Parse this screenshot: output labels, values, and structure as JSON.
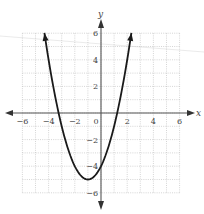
{
  "chart_data": {
    "type": "line",
    "title": "",
    "xlabel": "x",
    "ylabel": "y",
    "xlim": [
      -6,
      6
    ],
    "ylim": [
      -6,
      6
    ],
    "grid": true,
    "grid_step": 1,
    "x_ticks": [
      -6,
      -4,
      -2,
      0,
      2,
      4,
      6
    ],
    "x_tick_labels": [
      "−6",
      "−4",
      "−2",
      "0",
      "2",
      "4",
      "6"
    ],
    "y_ticks": [
      6,
      4,
      2,
      -2,
      -4,
      -6
    ],
    "y_tick_labels": [
      "6",
      "4",
      "2",
      "−2",
      "−4",
      "−6"
    ],
    "series": [
      {
        "name": "parabola",
        "equation": "y = (x + 1)^2 - 5",
        "vertex": [
          -1,
          -5
        ],
        "y_intercept": -4,
        "x_intercepts": [
          -3.24,
          1.24
        ],
        "x_range": [
          -4.32,
          2.32
        ],
        "arrows_at_ends": true,
        "color": "#1a1a1a"
      }
    ]
  }
}
